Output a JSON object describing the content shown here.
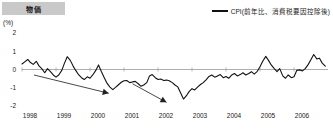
{
  "header": {
    "title": "物価",
    "title_bg": "#c9c9c9"
  },
  "legend": {
    "label": "CPI(前年比、消費税要因控除後)",
    "marker": "line-swatch",
    "color": "#111111"
  },
  "axis": {
    "unit_label": "(%)",
    "y_ticks": [
      "2",
      "1",
      "0",
      "-1",
      "-2"
    ],
    "x_ticks": [
      "1998",
      "1999",
      "2000",
      "2001",
      "2002",
      "2003",
      "2004",
      "2005",
      "2006"
    ]
  },
  "annotations": [
    {
      "name": "downtrend-arrow-1",
      "label": ""
    },
    {
      "name": "downtrend-arrow-2",
      "label": ""
    }
  ],
  "chart_data": {
    "type": "line",
    "title": "物価",
    "xlabel": "",
    "ylabel": "(%)",
    "ylim": [
      -2,
      2
    ],
    "xlim": [
      1998,
      2007
    ],
    "grid": false,
    "legend_position": "top-right",
    "zero_line": true,
    "series": [
      {
        "name": "CPI(前年比、消費税要因控除後)",
        "color": "#111111",
        "x": [
          1998.0,
          1998.08,
          1998.17,
          1998.25,
          1998.33,
          1998.42,
          1998.5,
          1998.58,
          1998.67,
          1998.75,
          1998.83,
          1998.92,
          1999.0,
          1999.08,
          1999.17,
          1999.25,
          1999.33,
          1999.42,
          1999.5,
          1999.58,
          1999.67,
          1999.75,
          1999.83,
          1999.92,
          2000.0,
          2000.08,
          2000.17,
          2000.25,
          2000.33,
          2000.42,
          2000.5,
          2000.58,
          2000.67,
          2000.75,
          2000.83,
          2000.92,
          2001.0,
          2001.08,
          2001.17,
          2001.25,
          2001.33,
          2001.42,
          2001.5,
          2001.58,
          2001.67,
          2001.75,
          2001.83,
          2001.92,
          2002.0,
          2002.08,
          2002.17,
          2002.25,
          2002.33,
          2002.42,
          2002.5,
          2002.58,
          2002.67,
          2002.75,
          2002.83,
          2002.92,
          2003.0,
          2003.08,
          2003.17,
          2003.25,
          2003.33,
          2003.42,
          2003.5,
          2003.58,
          2003.67,
          2003.75,
          2003.83,
          2003.92,
          2004.0,
          2004.08,
          2004.17,
          2004.25,
          2004.33,
          2004.42,
          2004.5,
          2004.58,
          2004.67,
          2004.75,
          2004.83,
          2004.92,
          2005.0,
          2005.08,
          2005.17,
          2005.25,
          2005.33,
          2005.42,
          2005.5,
          2005.58,
          2005.67,
          2005.75,
          2005.83,
          2005.92,
          2006.0,
          2006.08,
          2006.17,
          2006.25,
          2006.33,
          2006.42,
          2006.5,
          2006.58,
          2006.67,
          2006.75,
          2006.83,
          2006.92
        ],
        "values": [
          0.3,
          0.42,
          0.55,
          0.38,
          0.28,
          0.45,
          0.2,
          0.05,
          -0.18,
          0.05,
          -0.1,
          -0.3,
          -0.42,
          -0.3,
          -0.05,
          0.35,
          0.7,
          0.5,
          0.2,
          -0.05,
          -0.3,
          -0.45,
          -0.55,
          -0.4,
          -0.48,
          -0.3,
          -0.05,
          0.25,
          -0.1,
          -0.45,
          -0.75,
          -0.95,
          -1.1,
          -0.98,
          -0.85,
          -0.7,
          -0.62,
          -0.6,
          -0.72,
          -0.68,
          -0.65,
          -0.78,
          -0.92,
          -0.85,
          -0.72,
          -0.35,
          -0.28,
          -0.45,
          -0.55,
          -0.52,
          -0.6,
          -0.58,
          -0.62,
          -0.72,
          -0.85,
          -0.95,
          -1.3,
          -1.62,
          -1.45,
          -1.2,
          -1.05,
          -1.12,
          -0.95,
          -0.82,
          -0.72,
          -0.55,
          -0.38,
          -0.3,
          -0.42,
          -0.35,
          -0.28,
          -0.45,
          -0.38,
          -0.48,
          -0.3,
          -0.22,
          -0.35,
          -0.28,
          -0.18,
          -0.3,
          -0.22,
          -0.12,
          -0.25,
          -0.1,
          0.15,
          0.45,
          0.72,
          0.5,
          0.25,
          0.05,
          -0.12,
          0.05,
          -0.35,
          -0.48,
          -0.3,
          -0.45,
          -0.4,
          -0.05,
          -0.02,
          -0.08,
          0.05,
          0.28,
          0.55,
          0.82,
          0.58,
          0.62,
          0.35,
          0.18
        ]
      }
    ]
  }
}
